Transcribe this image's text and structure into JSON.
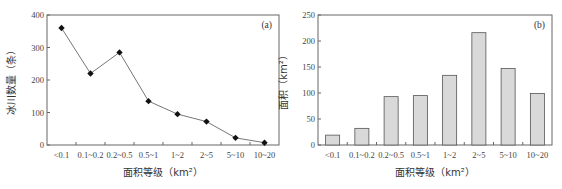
{
  "chart_data": [
    {
      "type": "line",
      "panel_label": "(a)",
      "title": "",
      "xlabel": "面积等级（km²）",
      "ylabel": "冰川数量（条）",
      "categories": [
        "<0.1",
        "0.1~0.2",
        "0.2~0.5",
        "0.5~1",
        "1~2",
        "2~5",
        "5~10",
        "10~20"
      ],
      "values": [
        360,
        220,
        285,
        135,
        95,
        72,
        22,
        7
      ],
      "ylim": [
        0,
        400
      ],
      "yticks": [
        0,
        100,
        200,
        300,
        400
      ],
      "grid": false,
      "marker": "diamond",
      "line_color": "#777777",
      "marker_color": "#111111"
    },
    {
      "type": "bar",
      "panel_label": "(b)",
      "title": "",
      "xlabel": "面积等级（km²）",
      "ylabel": "面积（km²）",
      "categories": [
        "<0.1",
        "0.1~0.2",
        "0.2~0.5",
        "0.5~1",
        "1~2",
        "2~5",
        "5~10",
        "10~20"
      ],
      "values": [
        19,
        32,
        93,
        95,
        134,
        216,
        147,
        99
      ],
      "ylim": [
        0,
        250
      ],
      "yticks": [
        0,
        50,
        100,
        150,
        200,
        250
      ],
      "grid": false,
      "bar_color": "#d9d9d9",
      "bar_edge": "#555555"
    }
  ]
}
